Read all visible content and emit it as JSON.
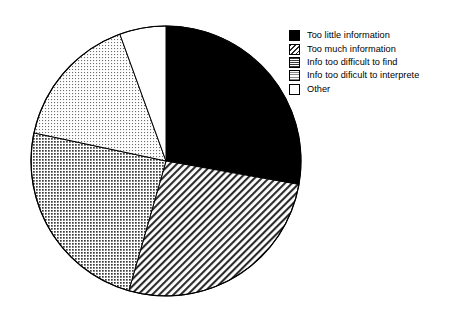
{
  "chart_data": {
    "type": "pie",
    "title": "",
    "subtitle": "",
    "xlabel": "",
    "ylabel": "",
    "grid": false,
    "legend_position": "right",
    "start_angle_deg": 0,
    "direction": "clockwise",
    "center": {
      "x": 166,
      "y": 161
    },
    "radius": 135,
    "categories": [
      "Too little information",
      "Too much information",
      "Info too difficult to find",
      "Info too dificult to interprete",
      "Other"
    ],
    "values": [
      27.8,
      26.7,
      23.9,
      16.1,
      5.5
    ],
    "slices": [
      {
        "label": "Too little information",
        "value": 27.8,
        "start_angle_deg": 0,
        "end_angle_deg": 100,
        "fill": "solid-black",
        "color": "#000000",
        "stroke": "#000000"
      },
      {
        "label": "Too much information",
        "value": 26.7,
        "start_angle_deg": 100,
        "end_angle_deg": 196,
        "fill": "diagonal-hatch",
        "color": "#ffffff",
        "stroke": "#000000"
      },
      {
        "label": "Info too difficult to find",
        "value": 23.9,
        "start_angle_deg": 196,
        "end_angle_deg": 282,
        "fill": "cross-hatch-grid",
        "color": "#b5b5b5",
        "stroke": "#000000"
      },
      {
        "label": "Info too dificult to interprete",
        "value": 16.1,
        "start_angle_deg": 282,
        "end_angle_deg": 340,
        "fill": "fine-dotted",
        "color": "#e3e3e3",
        "stroke": "#000000"
      },
      {
        "label": "Other",
        "value": 5.5,
        "start_angle_deg": 340,
        "end_angle_deg": 360,
        "fill": "none-white",
        "color": "#ffffff",
        "stroke": "#000000"
      }
    ],
    "ylim": [
      0,
      100
    ]
  },
  "legend": {
    "items": [
      {
        "label": "Too little information",
        "swatch": "solid-black-swatch"
      },
      {
        "label": "Too much information",
        "swatch": "diagonal-hatch-swatch"
      },
      {
        "label": "Info too difficult to find",
        "swatch": "cross-hatch-grid-swatch"
      },
      {
        "label": "Info too dificult to interprete",
        "swatch": "fine-dotted-swatch"
      },
      {
        "label": "Other",
        "swatch": "white-swatch"
      }
    ]
  },
  "colors": {
    "background": "#ffffff",
    "outline": "#000000",
    "text": "#000000",
    "slice_black": "#000000",
    "slice_grid": "#b5b5b5",
    "slice_dotted": "#e3e3e3",
    "slice_white": "#ffffff"
  }
}
